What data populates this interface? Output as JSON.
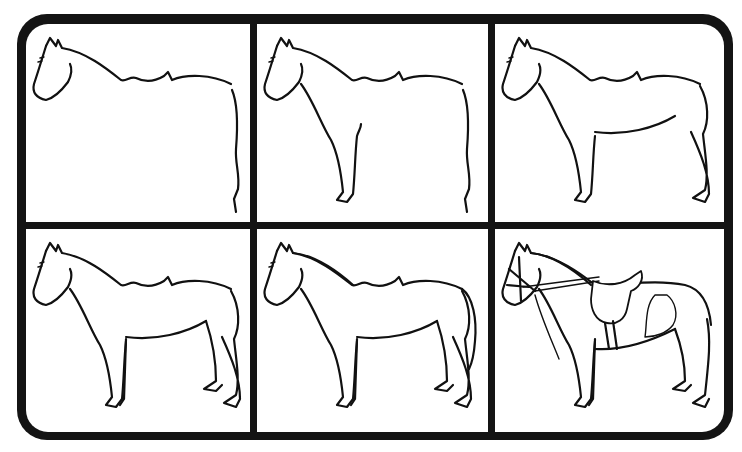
{
  "figure": {
    "layout": {
      "columns": 3,
      "rows": 2
    },
    "colors": {
      "frame": "#141414",
      "panel": "#ffffff",
      "line": "#111111"
    },
    "steps": [
      {
        "index": 1,
        "content": "Head, neck and back outline with rear contour"
      },
      {
        "index": 2,
        "content": "Adds chest and front leg"
      },
      {
        "index": 3,
        "content": "Adds belly and hind leg"
      },
      {
        "index": 4,
        "content": "Adds second front and hind legs"
      },
      {
        "index": 5,
        "content": "Adds mane and tail"
      },
      {
        "index": 6,
        "content": "Finished horse with bridle, reins, saddle and markings"
      }
    ]
  }
}
